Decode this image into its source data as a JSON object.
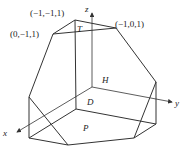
{
  "diagram": {
    "axes": {
      "x_label": "x",
      "y_label": "y",
      "z_label": "z"
    },
    "vertex_labels": {
      "top": "(−1,−1,1)",
      "left": "(0,−1,1)",
      "right": "(−1,0,1)"
    },
    "face_labels": {
      "T": "T",
      "H": "H",
      "D": "D",
      "P": "P"
    },
    "colors": {
      "line": "#333333",
      "text": "#222222",
      "background": "#ffffff"
    }
  }
}
